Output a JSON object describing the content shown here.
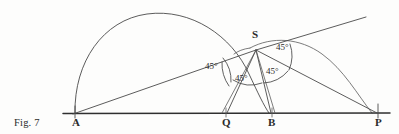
{
  "figure": {
    "caption": "Fig. 7",
    "width": 399,
    "height": 134,
    "background_color": "#fdfdfc",
    "ink_color": "#4a4a4a",
    "baseline_color": "#2f2f2f"
  },
  "points": [
    {
      "id": "A",
      "label": "A",
      "x": 75,
      "y": 113,
      "label_x": 72,
      "label_y": 117
    },
    {
      "id": "Q",
      "label": "Q",
      "x": 226,
      "y": 113,
      "label_x": 222,
      "label_y": 117
    },
    {
      "id": "B",
      "label": "B",
      "x": 272,
      "y": 113,
      "label_x": 268,
      "label_y": 117
    },
    {
      "id": "P",
      "label": "P",
      "x": 378,
      "y": 113,
      "label_x": 375,
      "label_y": 117
    },
    {
      "id": "S",
      "label": "S",
      "x": 256,
      "y": 50,
      "label_x": 252,
      "label_y": 29
    }
  ],
  "angles": [
    {
      "id": "angle-left",
      "label": "45°",
      "x": 205,
      "y": 62,
      "vertex": "S",
      "value": 45
    },
    {
      "id": "angle-top-right",
      "label": "45°",
      "x": 276,
      "y": 43,
      "vertex": "S",
      "value": 45
    },
    {
      "id": "angle-bottom-mid",
      "label": "45°",
      "x": 235,
      "y": 74,
      "vertex": "S",
      "value": 45
    },
    {
      "id": "angle-bottom-right",
      "label": "45°",
      "x": 266,
      "y": 67,
      "vertex": "S",
      "value": 45
    }
  ],
  "segments": [
    {
      "id": "baseline",
      "from": "A",
      "to": "P",
      "description": "horizontal base line A to P"
    },
    {
      "id": "ray-A-S",
      "from": "A",
      "to": "S",
      "description": "ray from A through S extended upper right"
    },
    {
      "id": "chord-S-Q",
      "from": "S",
      "to": "Q",
      "description": "line from S to Q"
    },
    {
      "id": "chord-S-B",
      "from": "S",
      "to": "B",
      "description": "line from S to B"
    },
    {
      "id": "chord-S-P",
      "from": "S",
      "to": "P",
      "description": "line from S to P"
    }
  ],
  "arcs": [
    {
      "id": "semicircle-AP",
      "description": "large semicircle on diameter A to P"
    },
    {
      "id": "arc-S-P",
      "description": "smaller arc passing from near S down to P"
    }
  ]
}
